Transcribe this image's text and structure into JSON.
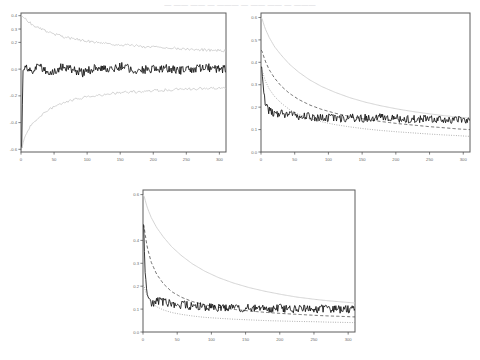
{
  "header": {
    "cropped_text": "— —— —— —  ——— — ——  —— — ———"
  },
  "figure": {
    "background": "#ffffff",
    "frame_color": "#5d5d5d",
    "panel_count": 3,
    "layout": "two-panels-top-one-centered-bottom"
  },
  "chart_data": [
    {
      "id": "panel-top-left",
      "type": "line",
      "title": "",
      "xlabel": "",
      "ylabel": "",
      "xlim": [
        0,
        310
      ],
      "ylim": [
        -0.62,
        0.42
      ],
      "xticks": [
        0,
        50,
        100,
        150,
        200,
        250,
        300
      ],
      "xticklabels": [
        "0",
        "50",
        "100",
        "150",
        "200",
        "250",
        "300"
      ],
      "yticks": [
        0.4,
        0.3,
        0.2,
        0.0,
        -0.2,
        -0.4,
        -0.6
      ],
      "yticklabels": [
        "0.4",
        "0.3",
        "0.2",
        "0.0",
        "-0.2",
        "-0.4",
        "-0.6"
      ],
      "grid": false,
      "legend": "none",
      "series": [
        {
          "name": "upper-envelope",
          "style": "solid",
          "color": "#c6c6c6",
          "x": [
            1,
            4,
            8,
            14,
            20,
            28,
            38,
            50,
            62,
            76,
            90,
            105,
            120,
            138,
            155,
            172,
            190,
            208,
            225,
            245,
            262,
            280,
            295,
            308
          ],
          "values": [
            0.4,
            0.385,
            0.368,
            0.345,
            0.325,
            0.305,
            0.285,
            0.262,
            0.245,
            0.23,
            0.218,
            0.207,
            0.198,
            0.188,
            0.18,
            0.174,
            0.168,
            0.163,
            0.158,
            0.152,
            0.148,
            0.144,
            0.141,
            0.138
          ]
        },
        {
          "name": "center-noisy",
          "style": "solid",
          "color": "#111111",
          "x": [
            1,
            3,
            6,
            10,
            16,
            24,
            34,
            46,
            60,
            76,
            94,
            112,
            132,
            152,
            174,
            196,
            218,
            240,
            262,
            284,
            302
          ],
          "values": [
            -0.6,
            0.02,
            0.0,
            0.01,
            -0.01,
            0.02,
            0.0,
            -0.02,
            0.01,
            0.0,
            -0.03,
            0.01,
            0.0,
            0.02,
            -0.01,
            0.0,
            0.01,
            -0.01,
            0.0,
            0.01,
            0.0
          ]
        },
        {
          "name": "lower-envelope",
          "style": "solid",
          "color": "#c6c6c6",
          "x": [
            1,
            4,
            8,
            14,
            20,
            28,
            38,
            50,
            62,
            76,
            90,
            105,
            120,
            138,
            155,
            172,
            190,
            208,
            225,
            245,
            262,
            280,
            295,
            308
          ],
          "values": [
            -0.6,
            -0.535,
            -0.48,
            -0.43,
            -0.392,
            -0.352,
            -0.315,
            -0.28,
            -0.255,
            -0.234,
            -0.217,
            -0.204,
            -0.193,
            -0.183,
            -0.175,
            -0.169,
            -0.163,
            -0.158,
            -0.154,
            -0.15,
            -0.146,
            -0.143,
            -0.141,
            -0.139
          ]
        }
      ]
    },
    {
      "id": "panel-top-right",
      "type": "line",
      "title": "",
      "xlabel": "",
      "ylabel": "",
      "xlim": [
        0,
        310
      ],
      "ylim": [
        0.0,
        0.62
      ],
      "xticks": [
        0,
        50,
        100,
        150,
        200,
        250,
        300
      ],
      "xticklabels": [
        "0",
        "50",
        "100",
        "150",
        "200",
        "250",
        "300"
      ],
      "yticks": [
        0.6,
        0.5,
        0.4,
        0.3,
        0.2,
        0.1,
        0.0
      ],
      "yticklabels": [
        "0.6",
        "0.5",
        "0.4",
        "0.3",
        "0.2",
        "0.1",
        "0.0"
      ],
      "grid": false,
      "legend": "none",
      "series": [
        {
          "name": "gray-solid-upper",
          "style": "solid",
          "color": "#cfcfcf",
          "x": [
            1,
            6,
            12,
            20,
            30,
            42,
            56,
            72,
            90,
            110,
            132,
            155,
            178,
            202,
            226,
            250,
            272,
            292,
            308
          ],
          "values": [
            0.6,
            0.552,
            0.512,
            0.47,
            0.432,
            0.392,
            0.356,
            0.322,
            0.292,
            0.266,
            0.242,
            0.222,
            0.206,
            0.192,
            0.18,
            0.17,
            0.162,
            0.156,
            0.152
          ]
        },
        {
          "name": "dashed-mid",
          "style": "dashed",
          "color": "#4e4e4e",
          "x": [
            1,
            6,
            12,
            20,
            30,
            42,
            56,
            72,
            90,
            110,
            132,
            155,
            178,
            202,
            226,
            250,
            272,
            292,
            308
          ],
          "values": [
            0.455,
            0.408,
            0.368,
            0.33,
            0.294,
            0.262,
            0.234,
            0.21,
            0.19,
            0.173,
            0.158,
            0.146,
            0.136,
            0.127,
            0.12,
            0.113,
            0.108,
            0.103,
            0.1
          ]
        },
        {
          "name": "black-noisy",
          "style": "solid",
          "color": "#111111",
          "x": [
            1,
            3,
            6,
            10,
            16,
            24,
            34,
            46,
            60,
            76,
            94,
            112,
            132,
            152,
            174,
            196,
            218,
            240,
            262,
            284,
            302
          ],
          "values": [
            0.38,
            0.3,
            0.215,
            0.19,
            0.178,
            0.172,
            0.17,
            0.165,
            0.16,
            0.156,
            0.152,
            0.15,
            0.152,
            0.15,
            0.154,
            0.152,
            0.148,
            0.146,
            0.144,
            0.142,
            0.14
          ]
        },
        {
          "name": "dotted-lower",
          "style": "dotted",
          "color": "#8a8a8a",
          "x": [
            1,
            6,
            12,
            20,
            30,
            42,
            56,
            72,
            90,
            110,
            132,
            155,
            178,
            202,
            226,
            250,
            272,
            292,
            308
          ],
          "values": [
            0.372,
            0.32,
            0.282,
            0.248,
            0.218,
            0.19,
            0.168,
            0.15,
            0.135,
            0.122,
            0.112,
            0.103,
            0.096,
            0.09,
            0.085,
            0.08,
            0.076,
            0.073,
            0.07
          ]
        }
      ]
    },
    {
      "id": "panel-bottom-center",
      "type": "line",
      "title": "",
      "xlabel": "",
      "ylabel": "",
      "xlim": [
        0,
        310
      ],
      "ylim": [
        0.0,
        0.62
      ],
      "xticks": [
        0,
        50,
        100,
        150,
        200,
        250,
        300
      ],
      "xticklabels": [
        "0",
        "50",
        "100",
        "150",
        "200",
        "250",
        "300"
      ],
      "yticks": [
        0.6,
        0.4,
        0.3,
        0.2,
        0.1,
        0.0
      ],
      "yticklabels": [
        "0.6",
        "0.4",
        "0.3",
        "0.2",
        "0.1",
        "0.0"
      ],
      "grid": false,
      "legend": "none",
      "series": [
        {
          "name": "gray-solid-upper",
          "style": "solid",
          "color": "#cfcfcf",
          "x": [
            1,
            6,
            12,
            20,
            30,
            42,
            56,
            72,
            90,
            110,
            132,
            155,
            178,
            202,
            226,
            250,
            272,
            292,
            308
          ],
          "values": [
            0.6,
            0.545,
            0.5,
            0.456,
            0.414,
            0.372,
            0.334,
            0.298,
            0.266,
            0.238,
            0.214,
            0.194,
            0.178,
            0.164,
            0.152,
            0.143,
            0.136,
            0.131,
            0.127
          ]
        },
        {
          "name": "dashed-mid",
          "style": "dashed",
          "color": "#4e4e4e",
          "x": [
            1,
            6,
            12,
            20,
            30,
            42,
            56,
            72,
            90,
            110,
            132,
            155,
            178,
            202,
            226,
            250,
            272,
            292,
            308
          ],
          "values": [
            0.47,
            0.372,
            0.305,
            0.252,
            0.21,
            0.176,
            0.152,
            0.133,
            0.119,
            0.108,
            0.099,
            0.092,
            0.086,
            0.081,
            0.077,
            0.073,
            0.07,
            0.068,
            0.066
          ]
        },
        {
          "name": "black-noisy",
          "style": "solid",
          "color": "#111111",
          "x": [
            1,
            3,
            6,
            10,
            16,
            24,
            34,
            46,
            60,
            76,
            94,
            112,
            132,
            152,
            174,
            196,
            218,
            240,
            262,
            284,
            302
          ],
          "values": [
            0.47,
            0.25,
            0.155,
            0.132,
            0.128,
            0.134,
            0.126,
            0.122,
            0.118,
            0.112,
            0.108,
            0.106,
            0.104,
            0.106,
            0.103,
            0.104,
            0.102,
            0.1,
            0.101,
            0.099,
            0.098
          ]
        },
        {
          "name": "dotted-lower",
          "style": "dotted",
          "color": "#8a8a8a",
          "x": [
            1,
            6,
            12,
            20,
            30,
            42,
            56,
            72,
            90,
            110,
            132,
            155,
            178,
            202,
            226,
            250,
            272,
            292,
            308
          ],
          "values": [
            0.205,
            0.158,
            0.13,
            0.11,
            0.096,
            0.085,
            0.077,
            0.07,
            0.064,
            0.06,
            0.056,
            0.053,
            0.05,
            0.048,
            0.046,
            0.045,
            0.043,
            0.042,
            0.041
          ]
        }
      ]
    }
  ]
}
